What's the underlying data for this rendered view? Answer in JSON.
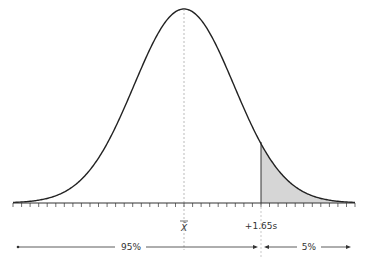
{
  "diagram": {
    "type": "normal-distribution-one-tailed",
    "mean_label": "X̄",
    "critical_label": "+1.65s",
    "left_region_label": "95%",
    "right_region_label": "5%",
    "colors": {
      "curve": "#222222",
      "shade": "#d6d6d6",
      "axis": "#333333",
      "dashed": "#aaaaaa"
    }
  },
  "chart_data": {
    "type": "area",
    "title": "",
    "distribution": "normal",
    "mean_label": "X̄",
    "critical_value_label": "+1.65s",
    "shaded_region": "right tail beyond +1.65s",
    "annotations": [
      "95%",
      "5%"
    ],
    "tick_count": 40
  }
}
